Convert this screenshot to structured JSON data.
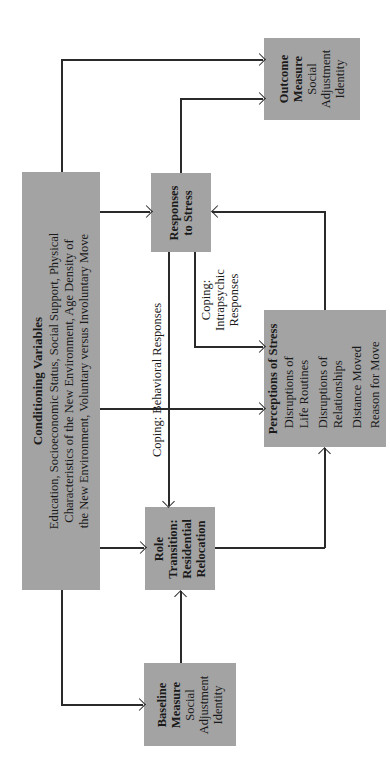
{
  "colors": {
    "box_fill": "#a3a3a3",
    "line": "#2a2a2a",
    "background": "#ffffff"
  },
  "nodes": {
    "conditioning": {
      "title": "Conditioning Variables",
      "lines": [
        "Education, Socioeconomic Status, Social Support, Physical",
        "Characteristics of the New Environment, Age Density of",
        "the New Environment, Voluntary versus Involuntary Move"
      ]
    },
    "baseline": {
      "title_lines": [
        "Baseline",
        "Measure"
      ],
      "lines": [
        "Social",
        "Adjustment",
        "Identity"
      ]
    },
    "role_transition": {
      "title_lines": [
        "Role",
        "Transition:",
        "Residential",
        "Relocation"
      ]
    },
    "responses": {
      "title_lines": [
        "Responses",
        "to Stress"
      ]
    },
    "perceptions": {
      "title": "Perceptions of Stress",
      "lines": [
        "Disruptions of",
        "Life Routines",
        "Disruptions of",
        "Relationships",
        "Distance Moved",
        "Reason for Move"
      ]
    },
    "outcome": {
      "title_lines": [
        "Outcome",
        "Measure"
      ],
      "lines": [
        "Social",
        "Adjustment",
        "Identity"
      ]
    }
  },
  "edge_labels": {
    "behavioral": "Coping: Behavioral Responses",
    "intrapsychic_lines": [
      "Coping:",
      "Intrapsychic",
      "Responses"
    ]
  },
  "edges": [
    {
      "from": "conditioning",
      "to": "outcome"
    },
    {
      "from": "conditioning",
      "to": "responses"
    },
    {
      "from": "conditioning",
      "to": "perceptions"
    },
    {
      "from": "conditioning",
      "to": "role_transition"
    },
    {
      "from": "conditioning",
      "to": "baseline"
    },
    {
      "from": "baseline",
      "to": "role_transition"
    },
    {
      "from": "role_transition",
      "to": "perceptions"
    },
    {
      "from": "perceptions",
      "to": "responses"
    },
    {
      "from": "responses",
      "to": "outcome"
    },
    {
      "from": "responses",
      "to": "role_transition",
      "label": "Coping: Behavioral Responses"
    },
    {
      "from": "responses",
      "to": "perceptions",
      "label": "Coping: Intrapsychic Responses"
    }
  ]
}
